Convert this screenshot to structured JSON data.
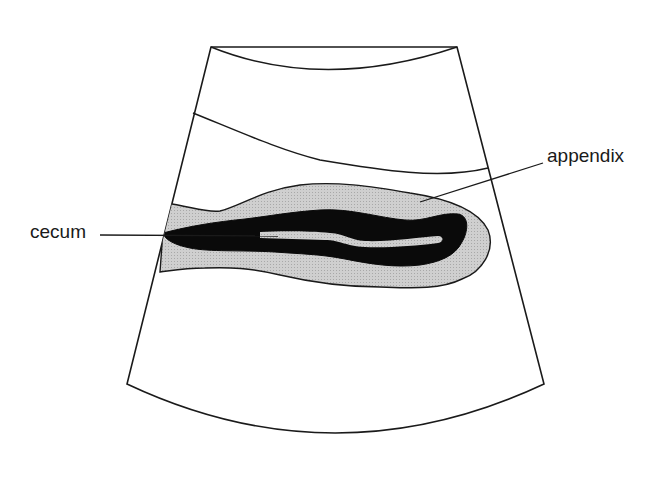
{
  "figure": {
    "type": "ultrasound schematic",
    "labels": {
      "cecum": "cecum",
      "appendix": "appendix"
    },
    "colors": {
      "outline": "#1a1a1a",
      "wall_fill": "#c8c8c8",
      "mucosa_fill": "#0a0a0a",
      "lumen_fill": "#c8c8c8",
      "background": "#ffffff"
    }
  }
}
